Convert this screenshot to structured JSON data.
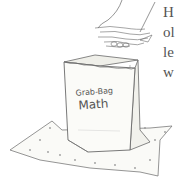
{
  "illustration": {
    "bag_label_line1": "Grab-Bag",
    "bag_label_line2": "Math",
    "description": "Hand dropping a bunch of pasta/objects into a paper bag sitting on a dotted mat"
  },
  "text_fragments": [
    {
      "text": "H"
    },
    {
      "text": "ol"
    },
    {
      "text": "le"
    },
    {
      "text": "w"
    }
  ],
  "colors": {
    "ink": "#6a6a6a",
    "text": "#555555",
    "bag_fill": "#fbfbf8",
    "mat_fill": "#fafaf7"
  }
}
